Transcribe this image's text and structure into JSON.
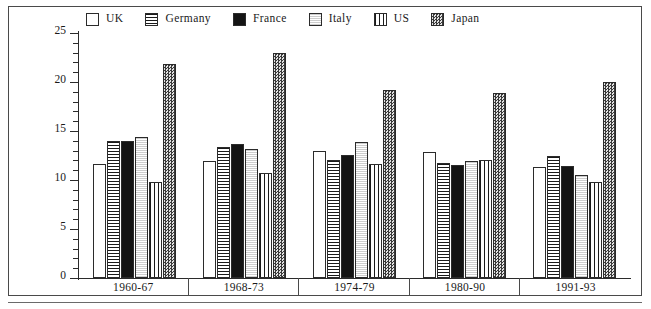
{
  "chart_data": {
    "type": "bar",
    "title": "",
    "subtitle": "",
    "xlabel": "",
    "ylabel": "",
    "ylim": [
      0,
      25
    ],
    "ytick_step_major": 5,
    "ytick_step_minor": 1,
    "ytick_labels": [
      "0",
      "5",
      "10",
      "15",
      "20",
      "25"
    ],
    "ytick_values": [
      0,
      5,
      10,
      15,
      20,
      25
    ],
    "grid": false,
    "legend_position": "top",
    "categories": [
      "1960-67",
      "1968-73",
      "1974-79",
      "1980-90",
      "1991-93"
    ],
    "series": [
      {
        "name": "UK",
        "pattern": "empty-white",
        "values": [
          11.6,
          11.9,
          13.0,
          12.9,
          11.3
        ]
      },
      {
        "name": "Germany",
        "pattern": "horizontal-lines",
        "values": [
          14.0,
          13.4,
          12.0,
          11.7,
          12.4
        ]
      },
      {
        "name": "France",
        "pattern": "solid-black",
        "values": [
          14.0,
          13.7,
          12.6,
          11.5,
          11.4
        ]
      },
      {
        "name": "Italy",
        "pattern": "light-stipple",
        "values": [
          14.4,
          13.2,
          13.9,
          11.9,
          10.5
        ]
      },
      {
        "name": "US",
        "pattern": "vertical-lines",
        "values": [
          9.8,
          10.7,
          11.6,
          12.0,
          9.8
        ]
      },
      {
        "name": "Japan",
        "pattern": "dark-checker",
        "values": [
          21.8,
          23.0,
          19.2,
          18.9,
          20.0
        ]
      }
    ]
  },
  "legend": {
    "items": [
      {
        "label": "UK"
      },
      {
        "label": "Germany"
      },
      {
        "label": "France"
      },
      {
        "label": "Italy"
      },
      {
        "label": "US"
      },
      {
        "label": "Japan"
      }
    ]
  },
  "colors": {
    "axis": "#2b2b2b",
    "frame": "#4a4a4a",
    "solid_fill": "#141414",
    "background": "#ffffff"
  }
}
